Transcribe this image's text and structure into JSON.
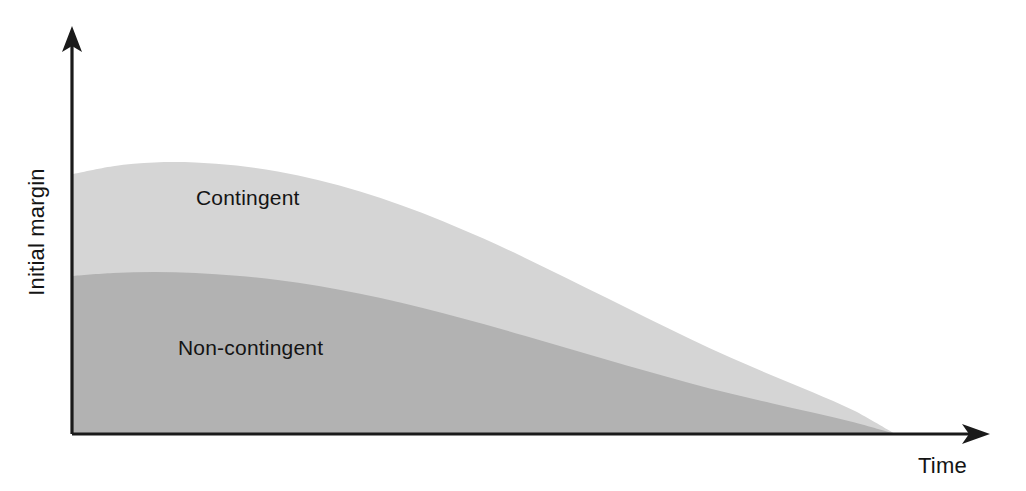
{
  "figure": {
    "width": 1026,
    "height": 491,
    "background": "#ffffff"
  },
  "axes": {
    "x_axis_name": "time-axis",
    "y_axis_name": "initial-margin-axis",
    "x_title": "Time",
    "y_title": "Initial margin",
    "axis_color": "#1a1a1a",
    "origin": {
      "x": 72,
      "y": 434
    },
    "x_end": {
      "x": 988,
      "y": 434
    },
    "y_end": {
      "x": 72,
      "y": 28
    },
    "ticks_visible": false,
    "gridlines_visible": false
  },
  "labels": {
    "contingent": "Contingent",
    "non_contingent": "Non-contingent",
    "contingent_pos": {
      "x": 196,
      "y": 205
    },
    "non_contingent_pos": {
      "x": 178,
      "y": 355
    },
    "time_pos": {
      "x": 918,
      "y": 470
    },
    "margin_pos": {
      "x": 44,
      "y": 232
    },
    "text_color": "#141414"
  },
  "colors": {
    "contingent_fill": "#d5d5d5",
    "non_contingent_fill": "#b2b2b2",
    "axis": "#1a1a1a",
    "text": "#141414",
    "background": "#ffffff"
  },
  "chart_data": {
    "type": "area",
    "title": "",
    "subtitle": "",
    "xlabel": "Time",
    "ylabel": "Initial margin",
    "stacked": true,
    "grid": false,
    "legend_position": "inline-annotation",
    "axis_style": "arrow-axes-no-ticks",
    "xlim": [
      0,
      100
    ],
    "ylim": [
      0,
      100
    ],
    "x_tick_labels": [],
    "y_tick_labels": [],
    "x": [
      0,
      5,
      10,
      15,
      20,
      25,
      30,
      35,
      40,
      45,
      50,
      55,
      60,
      65,
      70,
      75,
      80,
      85,
      90,
      95,
      100
    ],
    "series": [
      {
        "name": "Non-contingent",
        "label": "Non-contingent",
        "color": "#b2b2b2",
        "order": "bottom",
        "values": [
          47.3,
          48.2,
          48.5,
          48.2,
          47.4,
          46.1,
          44.3,
          42.0,
          39.3,
          36.2,
          32.9,
          29.4,
          25.8,
          22.2,
          18.7,
          15.3,
          12.1,
          9.2,
          6.4,
          3.5,
          0.0
        ]
      },
      {
        "name": "Contingent",
        "label": "Contingent",
        "color": "#d5d5d5",
        "order": "top",
        "values": [
          77.8,
          80.2,
          81.3,
          81.3,
          80.4,
          78.6,
          76.0,
          72.6,
          68.5,
          63.8,
          58.5,
          52.8,
          46.8,
          40.7,
          34.6,
          28.6,
          22.9,
          17.6,
          12.5,
          7.0,
          0.0
        ]
      }
    ],
    "annotations": [
      {
        "text": "Contingent",
        "x": 14,
        "y": 62
      },
      {
        "text": "Non-contingent",
        "x": 12,
        "y": 25
      }
    ]
  }
}
